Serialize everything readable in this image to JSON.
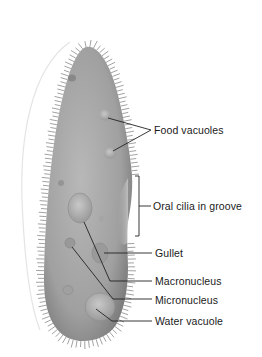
{
  "diagram": {
    "colors": {
      "body_fill": "#9c9c9c",
      "body_light": "#c4c4c4",
      "body_dark": "#6e6e6e",
      "cilia": "#8a8a8a",
      "leader_line": "#222222",
      "text": "#1a1a1a",
      "background": "#ffffff"
    },
    "labels": [
      {
        "id": "food-vacuoles",
        "text": "Food vacuoles",
        "x": 154,
        "y": 124
      },
      {
        "id": "oral-cilia",
        "text": "Oral cilia in groove",
        "x": 153,
        "y": 200
      },
      {
        "id": "gullet",
        "text": "Gullet",
        "x": 155,
        "y": 247
      },
      {
        "id": "macronucleus",
        "text": "Macronucleus",
        "x": 155,
        "y": 275
      },
      {
        "id": "micronucleus",
        "text": "Micronucleus",
        "x": 155,
        "y": 294
      },
      {
        "id": "water-vacuole",
        "text": "Water vacuole",
        "x": 155,
        "y": 315
      }
    ]
  }
}
